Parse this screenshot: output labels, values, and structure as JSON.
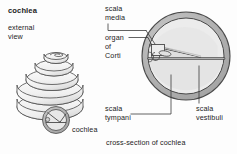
{
  "figure": {
    "title": "cochlea",
    "subtitle_line1": "external",
    "subtitle_line2": "view",
    "caption": "cross-section of cochlea",
    "shell_label": "cochlea"
  },
  "labels": {
    "scala_media_line1": "scala",
    "scala_media_line2": "media",
    "organ_of_corti_line1": "organ",
    "organ_of_corti_line2": "of",
    "organ_of_corti_line3": "Corti",
    "scala_tympani_line1": "scala",
    "scala_tympani_line2": "tympani",
    "scala_vestibuli_line1": "scala",
    "scala_vestibuli_line2": "vestibuli"
  },
  "colors": {
    "background": "#fdfdfd",
    "text": "#1c1c1c",
    "outline": "#4a4a4a",
    "wall_fill": "#b5b5b5",
    "chamber_fill": "#ececec",
    "shell_fill": "#efefef",
    "shell_shadow": "#d6d6d6",
    "leader": "#3a3a3a"
  }
}
